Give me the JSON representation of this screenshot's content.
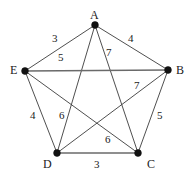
{
  "figure": {
    "title": "",
    "background_color": "#ffffff",
    "vertex_color": "#111111",
    "edge_color": "#3b3b3b",
    "label_color": "#1a1a1a"
  },
  "chart_data": {
    "type": "diagram",
    "diagram_kind": "weighted-undirected-graph",
    "title": "",
    "xlabel": "",
    "ylabel": "",
    "grid": false,
    "legend": "none",
    "nodes": [
      {
        "id": "A",
        "label": "A",
        "x": 95,
        "y": 25,
        "label_x": 90,
        "label_y": 9
      },
      {
        "id": "B",
        "label": "B",
        "x": 168,
        "y": 70,
        "label_x": 176,
        "label_y": 64
      },
      {
        "id": "C",
        "label": "C",
        "x": 138,
        "y": 153,
        "label_x": 147,
        "label_y": 158
      },
      {
        "id": "D",
        "label": "D",
        "x": 57,
        "y": 153,
        "label_x": 43,
        "label_y": 158
      },
      {
        "id": "E",
        "label": "E",
        "x": 25,
        "y": 71,
        "label_x": 10,
        "label_y": 64
      }
    ],
    "edges": [
      {
        "from": "A",
        "to": "E",
        "weight": 3,
        "label_x": 52,
        "label_y": 33,
        "emphasis": false
      },
      {
        "from": "A",
        "to": "B",
        "weight": 4,
        "label_x": 128,
        "label_y": 33,
        "emphasis": false
      },
      {
        "from": "A",
        "to": "C",
        "weight": 7,
        "label_x": 106,
        "label_y": 47,
        "emphasis": false
      },
      {
        "from": "A",
        "to": "D",
        "weight": 6,
        "label_x": 59,
        "label_y": 110,
        "emphasis": false
      },
      {
        "from": "E",
        "to": "B",
        "weight": 5,
        "label_x": 58,
        "label_y": 52,
        "emphasis": true
      },
      {
        "from": "E",
        "to": "D",
        "weight": 4,
        "label_x": 30,
        "label_y": 110,
        "emphasis": false
      },
      {
        "from": "E",
        "to": "C",
        "weight": 6,
        "label_x": 105,
        "label_y": 134,
        "emphasis": false
      },
      {
        "from": "B",
        "to": "D",
        "weight": 7,
        "label_x": 134,
        "label_y": 80,
        "emphasis": false
      },
      {
        "from": "B",
        "to": "C",
        "weight": 5,
        "label_x": 157,
        "label_y": 110,
        "emphasis": false
      },
      {
        "from": "D",
        "to": "C",
        "weight": 3,
        "label_x": 94,
        "label_y": 159,
        "emphasis": true
      }
    ]
  }
}
